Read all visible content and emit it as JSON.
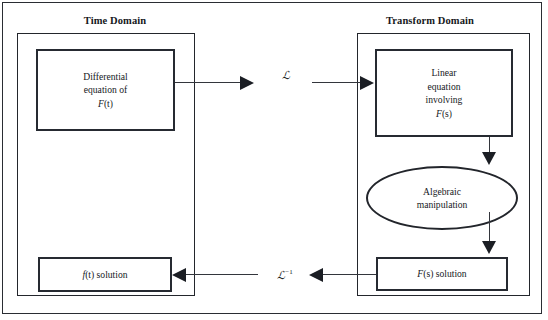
{
  "figure": {
    "width": 548,
    "height": 320,
    "background_color": "#ffffff",
    "line_color": "#262a31",
    "text_color": "#16181c"
  },
  "panels": {
    "time": {
      "title": "Time Domain"
    },
    "transform": {
      "title": "Transform Domain"
    }
  },
  "nodes": {
    "differential_equation": {
      "line1": "Differential",
      "line2": "equation of",
      "line3_var": "F",
      "line3_arg": "(t)"
    },
    "linear_equation": {
      "line1": "Linear",
      "line2": "equation",
      "line3": "involving",
      "line4_var": "F",
      "line4_arg": "(s)"
    },
    "algebraic_manipulation": {
      "line1": "Algebraic",
      "line2": "manipulation"
    },
    "fs_solution": {
      "var": "F",
      "arg": "(s)",
      "label": " solution"
    },
    "ft_solution": {
      "var": "f",
      "arg": "(t)",
      "label": " solution"
    }
  },
  "operators": {
    "laplace": {
      "symbol": "ℒ",
      "exponent": ""
    },
    "inverse_laplace": {
      "symbol": "ℒ",
      "exponent": "−1"
    }
  },
  "arrows": [
    {
      "name": "diff-to-laplace",
      "direction": "right"
    },
    {
      "name": "laplace-to-linear",
      "direction": "right"
    },
    {
      "name": "linear-to-ellipse",
      "direction": "down"
    },
    {
      "name": "ellipse-to-fs",
      "direction": "down"
    },
    {
      "name": "fs-to-inverse-laplace",
      "direction": "left"
    },
    {
      "name": "inverse-laplace-to-ft",
      "direction": "left"
    }
  ]
}
